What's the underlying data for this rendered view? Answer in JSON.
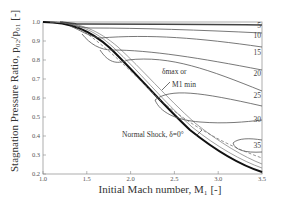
{
  "chart_data": {
    "type": "line",
    "title": "",
    "xlabel": "Initial Mach number, M1 [-]",
    "ylabel": "Stagnation Pressure Ratio, p02/p01 [-]",
    "xlim": [
      1.0,
      3.5
    ],
    "ylim": [
      0.2,
      1.0
    ],
    "grid": false,
    "x_ticks": [
      "1.0",
      "1.5",
      "2.0",
      "2.5",
      "3.0",
      "3.5"
    ],
    "y_ticks": [
      "0.2",
      "0.3",
      "0.4",
      "0.5",
      "0.6",
      "0.7",
      "0.8",
      "0.9",
      "1.0"
    ],
    "curve_labels": [
      "5",
      "10",
      "15",
      "20",
      "25",
      "30",
      "35"
    ],
    "series": [
      {
        "name": "Normal Shock, δ=0°",
        "x": [
          1.0,
          1.5,
          2.0,
          2.5,
          3.0,
          3.5
        ],
        "y": [
          1.0,
          0.93,
          0.72,
          0.5,
          0.33,
          0.21
        ]
      },
      {
        "name": "δ=5°",
        "x": [
          1.15,
          2.0,
          3.0,
          3.5
        ],
        "y": [
          1.0,
          0.997,
          0.993,
          0.99
        ]
      },
      {
        "name": "δ=10°",
        "x": [
          1.4,
          2.0,
          3.0,
          3.5
        ],
        "y": [
          0.99,
          0.985,
          0.97,
          0.96
        ]
      },
      {
        "name": "δ=15°",
        "x": [
          1.6,
          2.0,
          3.0,
          3.5
        ],
        "y": [
          0.97,
          0.96,
          0.91,
          0.89
        ]
      },
      {
        "name": "δ=20°",
        "x": [
          1.85,
          2.5,
          3.0,
          3.5
        ],
        "y": [
          0.92,
          0.88,
          0.83,
          0.79
        ]
      },
      {
        "name": "δ=25°",
        "x": [
          2.15,
          2.5,
          3.0,
          3.5
        ],
        "y": [
          0.84,
          0.79,
          0.73,
          0.66
        ]
      },
      {
        "name": "δ=30°",
        "x": [
          2.5,
          3.0,
          3.5
        ],
        "y": [
          0.69,
          0.62,
          0.54
        ]
      },
      {
        "name": "δ=35°",
        "x": [
          3.1,
          3.5
        ],
        "y": [
          0.47,
          0.43
        ]
      },
      {
        "name": "δmax or M1 min",
        "style": "dashed",
        "x": [
          1.5,
          2.0,
          2.5,
          3.0,
          3.5
        ],
        "y": [
          0.97,
          0.85,
          0.69,
          0.54,
          0.4
        ]
      }
    ],
    "annotations": [
      "δmax or M1 min",
      "Normal Shock, δ=0°"
    ]
  },
  "labels": {
    "ylabel": "Stagnation Pressure Ratio, p₀₂/p₀₁ [-]",
    "xlabel": "Initial Mach number, M₁ [-]",
    "ann_delta": "δmax or",
    "ann_mmin": "M1 min",
    "ann_normal": "Normal Shock, δ=0°"
  }
}
